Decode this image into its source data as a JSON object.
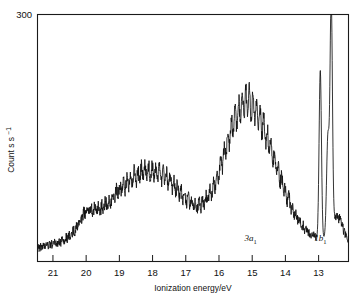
{
  "chart_data": {
    "type": "line",
    "title": "",
    "xlabel": "Ionization energy/eV",
    "ylabel": "Count s",
    "ylabel_exponent": "-1",
    "xlim": [
      21.45,
      12.1
    ],
    "ylim": [
      0,
      300
    ],
    "x_reversed": true,
    "grid": false,
    "legend": false,
    "y_axis_max_label": "300",
    "xticks": [
      21,
      20,
      19,
      18,
      17,
      16,
      15,
      14,
      13
    ],
    "xtick_labels": [
      "21",
      "20",
      "19",
      "18",
      "17",
      "16",
      "15",
      "14",
      "13"
    ],
    "annotations": [
      {
        "text_main": "3a",
        "text_sub": "1",
        "x": 15.05,
        "y": 24,
        "name": "band-label-3a1"
      },
      {
        "text_main": "1b",
        "text_sub": "1",
        "x": 12.95,
        "y": 24,
        "name": "band-label-1b1"
      }
    ],
    "series": [
      {
        "name": "He I photoelectron spectrum",
        "color": "#111111",
        "noise_amplitude": 7,
        "baseline": 14,
        "bands": [
          {
            "label": "2a1-region",
            "center": 20.0,
            "width": 0.22,
            "height": 16,
            "shape": "spike"
          },
          {
            "label": "1b2",
            "center": 18.45,
            "width": 1.15,
            "height": 68,
            "shape": "broad"
          },
          {
            "label": "1b2-shoulder",
            "center": 17.6,
            "width": 0.9,
            "height": 30,
            "shape": "broad"
          },
          {
            "label": "3a1",
            "center": 14.85,
            "width": 0.72,
            "height": 120,
            "shape": "broad"
          },
          {
            "label": "3a1-shoulder",
            "center": 15.45,
            "width": 0.55,
            "height": 70,
            "shape": "broad"
          },
          {
            "label": "1b1-v1",
            "center": 12.95,
            "width": 0.035,
            "height": 205,
            "shape": "sharp"
          },
          {
            "label": "1b1-v0",
            "center": 12.62,
            "width": 0.035,
            "height": 278,
            "shape": "sharp"
          },
          {
            "label": "1b1-v2",
            "center": 12.72,
            "width": 0.04,
            "height": 120,
            "shape": "sharp"
          },
          {
            "label": "1b1-tail",
            "center": 12.45,
            "width": 0.16,
            "height": 30,
            "shape": "sharp"
          }
        ]
      }
    ]
  },
  "axes": {
    "x_title": "Ionization energy/eV",
    "y_title_base": "Count s",
    "y_title_sup": "−1",
    "y_top_value": "300"
  }
}
